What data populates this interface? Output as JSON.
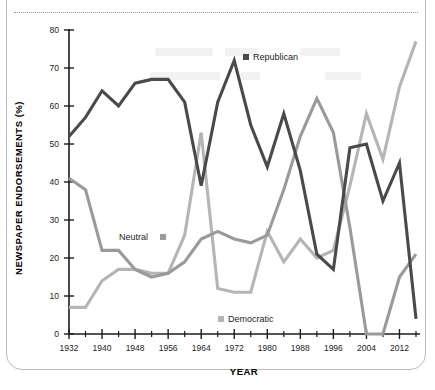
{
  "page": {
    "top_caption": "",
    "background_color": "#ffffff"
  },
  "axes": {
    "y_title": "NEWSPAPER ENDORSEMENTS (%)",
    "x_title": "YEAR",
    "y_ticks": [
      "0",
      "10",
      "20",
      "30",
      "40",
      "50",
      "60",
      "70",
      "80"
    ],
    "x_ticks": [
      "1932",
      "1940",
      "1948",
      "1956",
      "1964",
      "1972",
      "1980",
      "1988",
      "1996",
      "2004",
      "2012"
    ]
  },
  "legend": {
    "republican": "Republican",
    "neutral": "Neutral",
    "democratic": "Democratic"
  },
  "colors": {
    "republican": "#4a4a4a",
    "neutral": "#9a9a9a",
    "democratic": "#b5b5b5",
    "axis": "#1d1d1d",
    "frame": "#b9b9b9"
  },
  "chart_data": {
    "type": "line",
    "title": "",
    "xlabel": "YEAR",
    "ylabel": "NEWSPAPER ENDORSEMENTS (%)",
    "xlim": [
      1932,
      2016
    ],
    "ylim": [
      0,
      80
    ],
    "grid": false,
    "legend_position": "inline-annotations",
    "x": [
      1932,
      1936,
      1940,
      1944,
      1948,
      1952,
      1956,
      1960,
      1964,
      1968,
      1972,
      1976,
      1980,
      1984,
      1988,
      1992,
      1996,
      2000,
      2004,
      2008,
      2012,
      2016
    ],
    "xtick_values": [
      1932,
      1940,
      1948,
      1956,
      1964,
      1972,
      1980,
      1988,
      1996,
      2004,
      2012
    ],
    "ytick_values": [
      0,
      10,
      20,
      30,
      40,
      50,
      60,
      70,
      80
    ],
    "series": [
      {
        "name": "Republican",
        "color": "#4a4a4a",
        "values": [
          52,
          57,
          64,
          60,
          66,
          67,
          67,
          61,
          39,
          61,
          72,
          55,
          44,
          58,
          43,
          21,
          17,
          49,
          50,
          35,
          45,
          4
        ]
      },
      {
        "name": "Neutral",
        "color": "#9a9a9a",
        "values": [
          41,
          38,
          22,
          22,
          17,
          15,
          16,
          19,
          25,
          27,
          25,
          24,
          26,
          38,
          52,
          62,
          53,
          28,
          0,
          0,
          15,
          21
        ]
      },
      {
        "name": "Democratic",
        "color": "#b5b5b5",
        "values": [
          7,
          7,
          14,
          17,
          17,
          16,
          16,
          26,
          53,
          12,
          11,
          11,
          27,
          19,
          25,
          20,
          22,
          39,
          58,
          46,
          65,
          77
        ]
      }
    ]
  }
}
